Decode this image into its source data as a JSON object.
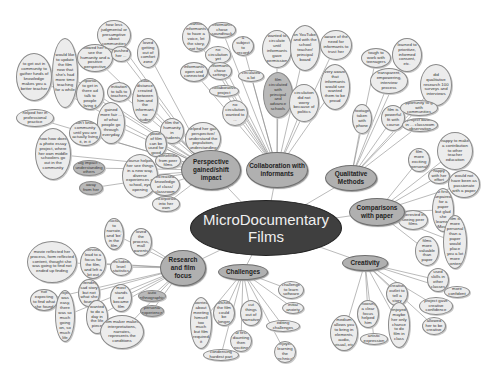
{
  "center": {
    "id": "center",
    "label": "MicroDocumentary Films",
    "x": 190,
    "y": 200,
    "w": 152,
    "h": 56
  },
  "branches": [
    {
      "id": "perspective",
      "label": "Perspective gained/shift impact",
      "x": 181,
      "y": 150,
      "w": 60,
      "h": 40
    },
    {
      "id": "collaboration",
      "label": "Collaboration with informants",
      "x": 246,
      "y": 152,
      "w": 62,
      "h": 36
    },
    {
      "id": "qualitative",
      "label": "Qualitative Methods",
      "x": 325,
      "y": 165,
      "w": 52,
      "h": 26
    },
    {
      "id": "comparisons",
      "label": "Comparisons with paper",
      "x": 349,
      "y": 198,
      "w": 56,
      "h": 28
    },
    {
      "id": "creativity",
      "label": "Creativity",
      "x": 342,
      "y": 255,
      "w": 46,
      "h": 16
    },
    {
      "id": "challenges",
      "label": "Challenges",
      "x": 218,
      "y": 264,
      "w": 50,
      "h": 16
    },
    {
      "id": "research",
      "label": "Research and film focus",
      "x": 160,
      "y": 250,
      "w": 46,
      "h": 36
    }
  ],
  "leaves": [
    {
      "parent": "perspective",
      "label": "would like to update the film now that she's had more time teaching for a while",
      "x": 52,
      "y": 38,
      "w": 26,
      "h": 70
    },
    {
      "parent": "perspective",
      "label": "to get out in community to gather funds of knowledge makes you a better teacher",
      "x": 16,
      "y": 53,
      "w": 36,
      "h": 48
    },
    {
      "parent": "perspective",
      "label": "helped her in professional practice",
      "x": 16,
      "y": 109,
      "w": 38,
      "h": 18
    },
    {
      "parent": "perspective",
      "label": "how less judgmental or presumptive about communities",
      "x": 97,
      "y": 20,
      "w": 34,
      "h": 30
    },
    {
      "parent": "perspective",
      "label": "allowed her to see the humanity and a positive perspective",
      "x": 77,
      "y": 44,
      "w": 36,
      "h": 28
    },
    {
      "parent": "perspective",
      "label": "pushed her ...",
      "x": 111,
      "y": 46,
      "w": 20,
      "h": 16
    },
    {
      "parent": "perspective",
      "label": "important to get in there ad talk to people living it",
      "x": 76,
      "y": 78,
      "w": 28,
      "h": 32
    },
    {
      "parent": "perspective",
      "label": "initiation to talk to teachers",
      "x": 107,
      "y": 82,
      "w": 24,
      "h": 20
    },
    {
      "parent": "perspective",
      "label": "gained more fair ... of what people go through everyday",
      "x": 97,
      "y": 102,
      "w": 28,
      "h": 42
    },
    {
      "parent": "perspective",
      "label": "don't know community until you are actually living it, in it",
      "x": 69,
      "y": 120,
      "w": 32,
      "h": 26
    },
    {
      "parent": "perspective",
      "label": "how how does a photo essay project, where her own middle schoolers go out in the community",
      "x": 35,
      "y": 128,
      "w": 36,
      "h": 52
    },
    {
      "parent": "perspective",
      "label": "big impact - understanding others",
      "x": 73,
      "y": 160,
      "w": 32,
      "h": 16,
      "dark": true
    },
    {
      "parent": "perspective",
      "label": "step away from her computer",
      "x": 79,
      "y": 181,
      "w": 24,
      "h": 14,
      "dark": true
    },
    {
      "parent": "perspective",
      "label": "loved getting out of comfort zone",
      "x": 137,
      "y": 38,
      "w": 22,
      "h": 30
    },
    {
      "parent": "perspective",
      "label": "valuable distance created between him and the informant, no student",
      "x": 132,
      "y": 79,
      "w": 26,
      "h": 44
    },
    {
      "parent": "perspective",
      "label": "film the humanity in students",
      "x": 160,
      "y": 118,
      "w": 24,
      "h": 26
    },
    {
      "parent": "perspective",
      "label": "power of film can be used for good",
      "x": 145,
      "y": 131,
      "w": 22,
      "h": 26
    },
    {
      "parent": "perspective",
      "label": "helped her gain perspective/ understand the population, understanding",
      "x": 185,
      "y": 122,
      "w": 36,
      "h": 34
    },
    {
      "parent": "perspective",
      "label": "benefitted from peer films",
      "x": 155,
      "y": 153,
      "w": 26,
      "h": 16
    },
    {
      "parent": "perspective",
      "label": "course helped her see things in a new way, diverse experiences at school, eye opening",
      "x": 122,
      "y": 154,
      "w": 36,
      "h": 44
    },
    {
      "parent": "perspective",
      "label": "increased knowledge of class/ classroom",
      "x": 150,
      "y": 174,
      "w": 30,
      "h": 22
    },
    {
      "parent": "perspective",
      "label": "can now incorporate into her own teaching",
      "x": 152,
      "y": 196,
      "w": 28,
      "h": 16
    },
    {
      "parent": "collaboration",
      "label": "wanted informants to have a voice, let the story, not her",
      "x": 182,
      "y": 22,
      "w": 28,
      "h": 30
    },
    {
      "parent": "collaboration",
      "label": "informants chose soundtrack",
      "x": 208,
      "y": 22,
      "w": 28,
      "h": 16
    },
    {
      "parent": "collaboration",
      "label": "wanted a subject to record her",
      "x": 232,
      "y": 36,
      "w": 22,
      "h": 20
    },
    {
      "parent": "collaboration",
      "label": "no circulation yet",
      "x": 205,
      "y": 46,
      "w": 26,
      "h": 18
    },
    {
      "parent": "collaboration",
      "label": "informants open and connected",
      "x": 180,
      "y": 62,
      "w": 28,
      "h": 20
    },
    {
      "parent": "collaboration",
      "label": "informants chose settings",
      "x": 208,
      "y": 62,
      "w": 24,
      "h": 18
    },
    {
      "parent": "collaboration",
      "label": "circulated a lot",
      "x": 238,
      "y": 70,
      "w": 26,
      "h": 12
    },
    {
      "parent": "collaboration",
      "label": "collaborative project",
      "x": 209,
      "y": 85,
      "w": 30,
      "h": 12
    },
    {
      "parent": "collaboration",
      "label": "no circulation wanted to ...",
      "x": 222,
      "y": 100,
      "w": 26,
      "h": 26
    },
    {
      "parent": "collaboration",
      "label": "wanted to circulate until informants gave permission",
      "x": 262,
      "y": 30,
      "w": 30,
      "h": 38
    },
    {
      "parent": "collaboration",
      "label": "on YouTube, and with the school teacher/ principal board",
      "x": 290,
      "y": 25,
      "w": 30,
      "h": 46
    },
    {
      "parent": "collaboration",
      "label": "aware of the need for informants to trust her",
      "x": 320,
      "y": 30,
      "w": 32,
      "h": 30
    },
    {
      "parent": "collaboration",
      "label": "film circulated with principal and advance schools",
      "x": 263,
      "y": 72,
      "w": 30,
      "h": 46,
      "dark": true
    },
    {
      "parent": "collaboration",
      "label": "circulation did not worry because of politics",
      "x": 289,
      "y": 84,
      "w": 30,
      "h": 38
    },
    {
      "parent": "collaboration",
      "label": "very aware that informants would see wanted them to be proud",
      "x": 320,
      "y": 64,
      "w": 30,
      "h": 46
    },
    {
      "parent": "qualitative",
      "label": "tough to work with teenagers",
      "x": 361,
      "y": 48,
      "w": 30,
      "h": 20
    },
    {
      "parent": "qualitative",
      "label": "learned to prioritize, informed consent, etc.",
      "x": 392,
      "y": 38,
      "w": 30,
      "h": 34
    },
    {
      "parent": "qualitative",
      "label": "transparent, empowering, interview process",
      "x": 370,
      "y": 68,
      "w": 38,
      "h": 26
    },
    {
      "parent": "qualitative",
      "label": "did qualitative research 100 surveys and interviews",
      "x": 420,
      "y": 64,
      "w": 32,
      "h": 42
    },
    {
      "parent": "qualitative",
      "label": "footage taken with phone",
      "x": 352,
      "y": 104,
      "w": 20,
      "h": 30
    },
    {
      "parent": "qualitative",
      "label": "film is powerful fit with course",
      "x": 381,
      "y": 105,
      "w": 24,
      "h": 26
    },
    {
      "parent": "qualitative",
      "label": "opportunity to go with communities",
      "x": 400,
      "y": 100,
      "w": 38,
      "h": 16
    },
    {
      "parent": "qualitative",
      "label": "project based in ... classroom observation",
      "x": 402,
      "y": 118,
      "w": 36,
      "h": 14
    },
    {
      "parent": "comparisons",
      "label": "happy to make a contribution to other teacher education",
      "x": 437,
      "y": 132,
      "w": 36,
      "h": 38
    },
    {
      "parent": "comparisons",
      "label": "film more exciting personal",
      "x": 408,
      "y": 148,
      "w": 22,
      "h": 24
    },
    {
      "parent": "comparisons",
      "label": "happy with her effort",
      "x": 428,
      "y": 168,
      "w": 22,
      "h": 16
    },
    {
      "parent": "comparisons",
      "label": "would not have been as passionate with a paper",
      "x": 448,
      "y": 170,
      "w": 32,
      "h": 28
    },
    {
      "parent": "comparisons",
      "label": "at first, unpaired for a paper but glad she learned iMovie",
      "x": 432,
      "y": 188,
      "w": 22,
      "h": 44
    },
    {
      "parent": "comparisons",
      "label": "interested in seeing peer films",
      "x": 398,
      "y": 210,
      "w": 30,
      "h": 20
    },
    {
      "parent": "comparisons",
      "label": "films more valuable than paper",
      "x": 415,
      "y": 236,
      "w": 24,
      "h": 30
    },
    {
      "parent": "comparisons",
      "label": "film is more personal than a paper would place you a lot more content",
      "x": 443,
      "y": 215,
      "w": 24,
      "h": 54
    },
    {
      "parent": "creativity",
      "label": "used skills in other classes",
      "x": 427,
      "y": 268,
      "w": 22,
      "h": 24
    },
    {
      "parent": "creativity",
      "label": "more confident",
      "x": 444,
      "y": 286,
      "w": 26,
      "h": 12
    },
    {
      "parent": "creativity",
      "label": "creative outlet to tell a story",
      "x": 386,
      "y": 282,
      "w": 22,
      "h": 24
    },
    {
      "parent": "creativity",
      "label": "project gave creative confidence",
      "x": 419,
      "y": 297,
      "w": 34,
      "h": 18
    },
    {
      "parent": "creativity",
      "label": "allowed her to be creative",
      "x": 422,
      "y": 317,
      "w": 24,
      "h": 18
    },
    {
      "parent": "creativity",
      "label": "choosing a clear focus helped him",
      "x": 357,
      "y": 300,
      "w": 22,
      "h": 28
    },
    {
      "parent": "creativity",
      "label": "enjoyed, maybe her only chance to do film in class",
      "x": 388,
      "y": 302,
      "w": 22,
      "h": 46
    },
    {
      "parent": "creativity",
      "label": "artistic expression",
      "x": 360,
      "y": 333,
      "w": 28,
      "h": 12
    },
    {
      "parent": "creativity",
      "label": "medium allows you to bring in elements, audio, visual, etc",
      "x": 330,
      "y": 315,
      "w": 28,
      "h": 36
    },
    {
      "parent": "challenges",
      "label": "challenge to learn software",
      "x": 278,
      "y": 281,
      "w": 26,
      "h": 18
    },
    {
      "parent": "challenges",
      "label": "initial anxiety",
      "x": 282,
      "y": 302,
      "w": 22,
      "h": 12
    },
    {
      "parent": "challenges",
      "label": "worried about meeting himself too much but film required it",
      "x": 190,
      "y": 297,
      "w": 22,
      "h": 52
    },
    {
      "parent": "challenges",
      "label": "wished the film could be longer",
      "x": 213,
      "y": 300,
      "w": 22,
      "h": 26
    },
    {
      "parent": "challenges",
      "label": "cut things out of narrative",
      "x": 240,
      "y": 300,
      "w": 22,
      "h": 26
    },
    {
      "parent": "challenges",
      "label": "editing challenges",
      "x": 266,
      "y": 320,
      "w": 34,
      "h": 12
    },
    {
      "parent": "challenges",
      "label": "at first daunting then exciting",
      "x": 230,
      "y": 330,
      "w": 22,
      "h": 22
    },
    {
      "parent": "challenges",
      "label": "condensing hardest part",
      "x": 203,
      "y": 349,
      "w": 36,
      "h": 12
    },
    {
      "parent": "challenges",
      "label": "enjoyed learning the technical",
      "x": 274,
      "y": 341,
      "w": 22,
      "h": 22
    },
    {
      "parent": "research",
      "label": "movie reflected her process, form reflected content, thought she was going to find not ended up finding",
      "x": 27,
      "y": 241,
      "w": 50,
      "h": 42
    },
    {
      "parent": "research",
      "label": "interviews lead to a focus for the film, and left a lot out",
      "x": 80,
      "y": 247,
      "w": 26,
      "h": 32
    },
    {
      "parent": "research",
      "label": "reluctant to narrate, and 'be' in the film",
      "x": 104,
      "y": 218,
      "w": 20,
      "h": 32
    },
    {
      "parent": "research",
      "label": "loved the process, mall parents",
      "x": 130,
      "y": 228,
      "w": 22,
      "h": 28
    },
    {
      "parent": "research",
      "label": "included level statistics",
      "x": 110,
      "y": 258,
      "w": 22,
      "h": 18
    },
    {
      "parent": "research",
      "label": "intending sad story but not what she found",
      "x": 78,
      "y": 279,
      "w": 22,
      "h": 28
    },
    {
      "parent": "research",
      "label": "what most stands out became film topic",
      "x": 110,
      "y": 284,
      "w": 22,
      "h": 28
    },
    {
      "parent": "research",
      "label": "auto ethnographic",
      "x": 138,
      "y": 290,
      "w": 28,
      "h": 12,
      "dark": true
    },
    {
      "parent": "research",
      "label": "personal experience",
      "x": 140,
      "y": 305,
      "w": 24,
      "h": 12,
      "dark": true
    },
    {
      "parent": "research",
      "label": "not expecting to find what she found",
      "x": 30,
      "y": 289,
      "w": 28,
      "h": 22
    },
    {
      "parent": "research",
      "label": "project was easy, there was so much going on, so much life",
      "x": 55,
      "y": 290,
      "w": 20,
      "h": 52
    },
    {
      "parent": "research",
      "label": "wanted to do a day in the life piece",
      "x": 86,
      "y": 300,
      "w": 22,
      "h": 34
    },
    {
      "parent": "research",
      "label": "film maker makes interpretations, narrates, represents the conditions",
      "x": 100,
      "y": 315,
      "w": 44,
      "h": 34
    }
  ]
}
